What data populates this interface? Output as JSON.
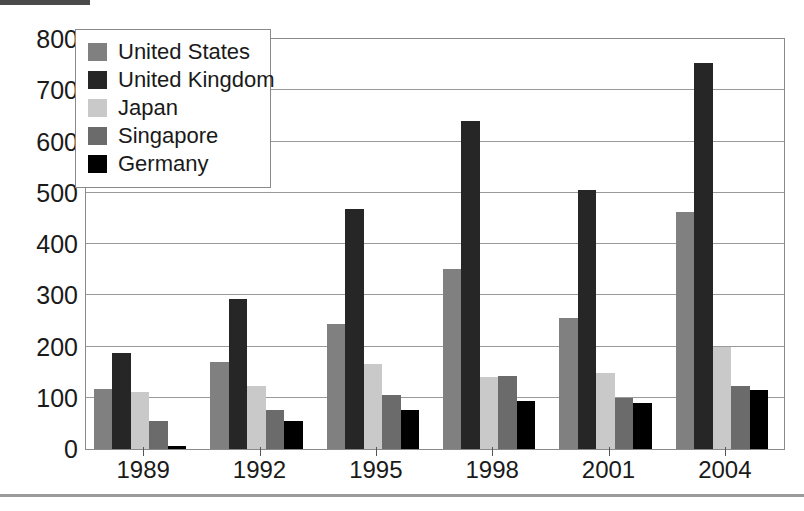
{
  "artifacts": {
    "top_text": "",
    "top_bar_label": "scan-artifact"
  },
  "chart_data": {
    "type": "bar",
    "title": "",
    "subtitle": "",
    "xlabel": "",
    "ylabel": "",
    "categories": [
      "1989",
      "1992",
      "1995",
      "1998",
      "2001",
      "2004"
    ],
    "ylim": [
      0,
      800
    ],
    "yticks": [
      0,
      100,
      200,
      300,
      400,
      500,
      600,
      700,
      800
    ],
    "ytick_labels": [
      "0",
      "100",
      "200",
      "300",
      "400",
      "500",
      "600",
      "700",
      "800"
    ],
    "grid": true,
    "grid_axis": "y",
    "legend_position": "upper-left-inside",
    "series": [
      {
        "name": "United States",
        "color": "#808080",
        "values": [
          118,
          170,
          243,
          352,
          255,
          462
        ]
      },
      {
        "name": "United Kingdom",
        "color": "#262626",
        "values": [
          188,
          293,
          469,
          640,
          506,
          753
        ]
      },
      {
        "name": "Japan",
        "color": "#c9c9c9",
        "values": [
          112,
          122,
          165,
          140,
          148,
          200
        ]
      },
      {
        "name": "Singapore",
        "color": "#6b6b6b",
        "values": [
          55,
          77,
          105,
          143,
          100,
          122
        ]
      },
      {
        "name": "Germany",
        "color": "#000000",
        "values": [
          5,
          55,
          77,
          93,
          90,
          116
        ]
      }
    ]
  }
}
